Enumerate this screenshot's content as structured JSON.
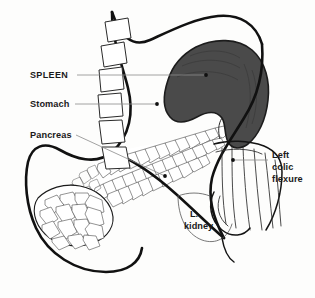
{
  "figure": {
    "background_color": "#fdfdfc",
    "width": 315,
    "height": 298
  },
  "labels": {
    "spleen": {
      "text": "SPLEEN",
      "style": "uppercase",
      "x": 30,
      "y": 78,
      "leader_from_x": 77,
      "leader_from_y": 75,
      "leader_to_x": 206,
      "leader_to_y": 75,
      "dot_x": 206,
      "dot_y": 75
    },
    "stomach": {
      "text": "Stomach",
      "style": "titlecase",
      "x": 30,
      "y": 107,
      "leader_from_x": 75,
      "leader_from_y": 104,
      "leader_to_x": 157,
      "leader_to_y": 104,
      "dot_x": 157,
      "dot_y": 104
    },
    "pancreas": {
      "text": "Pancreas",
      "style": "titlecase",
      "x": 30,
      "y": 138,
      "leader_from_x": 76,
      "leader_from_y": 135,
      "leader_to_x": 165,
      "leader_to_y": 176,
      "dot_x": 165,
      "dot_y": 176
    },
    "left_colic_flexure": {
      "lines": [
        "Left",
        "colic",
        "flexure"
      ],
      "x": 272,
      "y": 158,
      "line_height": 12,
      "leader_from_x": 268,
      "leader_from_y": 160,
      "leader_to_x": 233,
      "leader_to_y": 160,
      "dot_x": 233,
      "dot_y": 160
    },
    "l_kidney": {
      "lines": [
        "L.",
        "kidney"
      ],
      "x": 187,
      "y": 217,
      "line_height": 12
    }
  },
  "organs": [
    {
      "name": "stomach",
      "kind": "outline",
      "fill": "none",
      "stroke": "#111111",
      "stroke_width": 2.6
    },
    {
      "name": "spleen",
      "kind": "filled",
      "fill": "#4a4a4a",
      "stroke": "#1c1c1c",
      "stroke_width": 1.6
    },
    {
      "name": "pancreas",
      "kind": "lobulated",
      "fill": "#ffffff",
      "stroke": "#3a3a3a",
      "stroke_width": 0.55
    },
    {
      "name": "left-colic-flexure",
      "kind": "tube",
      "fill": "#ffffff",
      "stroke": "#2b2b2b",
      "stroke_width": 0.85
    },
    {
      "name": "left-kidney",
      "kind": "outline",
      "fill": "none",
      "stroke": "#555555",
      "stroke_width": 0.8
    },
    {
      "name": "vertebral-column",
      "kind": "segments",
      "fill": "#ffffff",
      "stroke": "#2a2a2a",
      "stroke_width": 1.0,
      "count": 6
    }
  ],
  "colors": {
    "spleen_fill": "#4a4a4a",
    "outline_dark": "#111111",
    "leader_gray": "#8a8a8a",
    "text": "#1a1a1a",
    "paper": "#fdfdfc"
  }
}
